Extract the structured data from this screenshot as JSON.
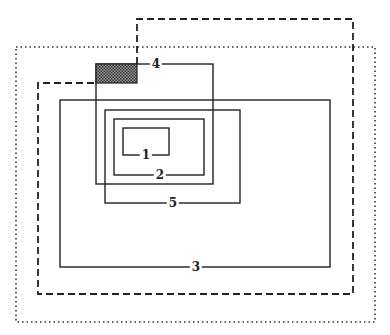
{
  "diagram": {
    "type": "nested-rectangles",
    "width": 390,
    "height": 335,
    "colors": {
      "stroke": "#222222",
      "shade": "#555555",
      "background": "#ffffff"
    },
    "outer_dotted_frame": {
      "x": 16,
      "y": 47,
      "w": 359,
      "h": 275,
      "style": "dotted"
    },
    "dashed_path": {
      "style": "dashed",
      "points": [
        [
          137,
          64
        ],
        [
          137,
          19
        ],
        [
          353,
          19
        ],
        [
          353,
          294
        ],
        [
          38,
          294
        ],
        [
          38,
          83
        ],
        [
          96,
          83
        ]
      ]
    },
    "shaded_block": {
      "x": 96,
      "y": 64,
      "w": 41,
      "h": 19,
      "pattern": "crosshatch"
    },
    "boxes": [
      {
        "id": "1",
        "label": "1",
        "x": 123,
        "y": 128,
        "w": 46,
        "h": 27,
        "label_pos": [
          146,
          155
        ]
      },
      {
        "id": "2",
        "label": "2",
        "x": 114,
        "y": 119,
        "w": 90,
        "h": 56,
        "label_pos": [
          160,
          174
        ]
      },
      {
        "id": "3",
        "label": "3",
        "x": 60,
        "y": 100,
        "w": 270,
        "h": 167,
        "label_pos": [
          196,
          267
        ]
      },
      {
        "id": "4",
        "label": "4",
        "x": 96,
        "y": 64,
        "w": 117,
        "h": 120,
        "label_pos": [
          156,
          64
        ]
      },
      {
        "id": "5",
        "label": "5",
        "x": 105,
        "y": 110,
        "w": 135,
        "h": 93,
        "label_pos": [
          173,
          203
        ]
      }
    ]
  },
  "labels": {
    "box1": "1",
    "box2": "2",
    "box3": "3",
    "box4": "4",
    "box5": "5"
  }
}
